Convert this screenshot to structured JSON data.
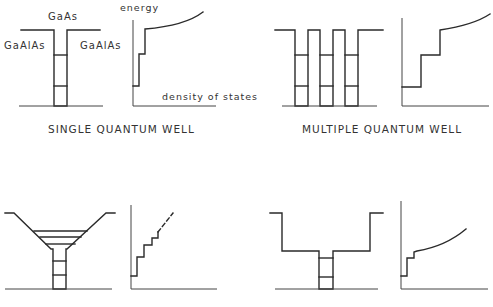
{
  "panels": [
    {
      "id": "single",
      "caption": "SINGLE QUANTUM WELL",
      "labels": {
        "well": "GaAs",
        "barrier_left": "GaAlAs",
        "barrier_right": "GaAlAs",
        "y_axis": "energy",
        "x_axis": "density of states"
      }
    },
    {
      "id": "multiple",
      "caption": "MULTIPLE QUANTUM WELL"
    },
    {
      "id": "graded",
      "caption": ""
    },
    {
      "id": "separate-confinement",
      "caption": ""
    }
  ],
  "colors": {
    "line": "#2a2a2a",
    "text": "#333333",
    "background": "#ffffff"
  }
}
